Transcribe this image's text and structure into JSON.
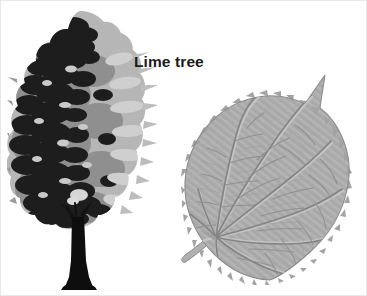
{
  "figure": {
    "title": "Lime tree",
    "background_color": "#ffffff",
    "width": 367,
    "height": 296
  },
  "label": {
    "text": "Lime tree",
    "color": "#1b1b1b"
  },
  "tree": {
    "name": "lime-tree",
    "common_name": "Lime tree",
    "foliage_dark_color": "#1d1d1d",
    "foliage_mid_color": "#5a5a5a",
    "foliage_light_color": "#b6b6b6",
    "trunk_color": "#0e0e0e",
    "form": "broad-oval dense canopy with straight central trunk"
  },
  "leaf": {
    "name": "lime-leaf",
    "shape": "cordate",
    "margin": "serrate",
    "fill_color": "#a9a9a9",
    "vein_color": "#8a8a8a",
    "vein_highlight_color": "#c3c3c3",
    "outline_color": "#8d8d8d",
    "venation": "palmate-pinnate",
    "has_petiole": true,
    "tip": "acuminate"
  }
}
